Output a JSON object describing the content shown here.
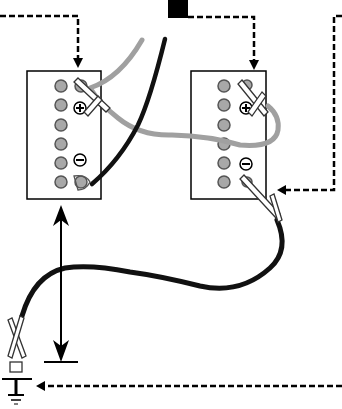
{
  "diagram": {
    "title": "",
    "colors": {
      "background": "#ffffff",
      "line": "#000000",
      "cell_fill": "#a8a8a8",
      "jumper_positive": "#a0a0a0",
      "jumper_negative": "#111111"
    },
    "batteries": [
      {
        "id": "left",
        "cells": 6,
        "terminals": [
          "positive",
          "negative"
        ]
      },
      {
        "id": "right",
        "cells": 6,
        "terminals": [
          "positive",
          "negative"
        ]
      }
    ],
    "symbols": {
      "positive": "+",
      "negative": "−"
    }
  }
}
